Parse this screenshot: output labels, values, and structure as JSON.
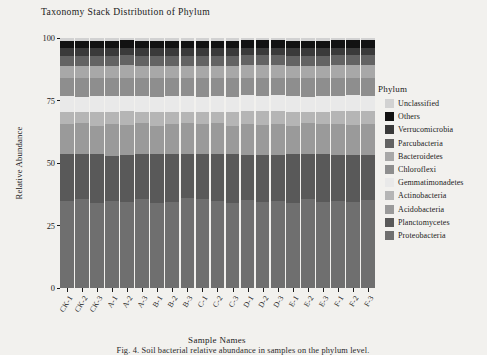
{
  "figure": {
    "title": "Taxonomy Stack Distribution of Phylum",
    "xlabel": "Sample Names",
    "ylabel": "Relative Abundance",
    "caption": "Fig. 4. Soil bacterial relative abundance in samples on the phylum level."
  },
  "legend": {
    "title": "Phylum"
  },
  "chart_data": {
    "type": "bar",
    "stacked": true,
    "title": "Taxonomy Stack Distribution of Phylum",
    "xlabel": "Sample Names",
    "ylabel": "Relative Abundance",
    "ylim": [
      0,
      100
    ],
    "yticks": [
      0,
      25,
      50,
      75,
      100
    ],
    "ytick_labels": [
      "0",
      "25",
      "50",
      "75",
      "100"
    ],
    "grid": false,
    "legend_position": "right",
    "legend_title": "Phylum",
    "categories": [
      "CK-1",
      "CK-2",
      "CK-3",
      "A-1",
      "A-2",
      "A-3",
      "B-1",
      "B-2",
      "B-3",
      "C-1",
      "C-2",
      "C-3",
      "D-1",
      "D-2",
      "D-3",
      "E-1",
      "E-2",
      "E-3",
      "F-1",
      "F-2",
      "F-3"
    ],
    "series": [
      {
        "name": "Proteobacteria",
        "color": "#6f6f6f",
        "values": [
          35.0,
          35.5,
          34.0,
          35.0,
          34.5,
          35.5,
          34.0,
          34.5,
          36.0,
          35.5,
          35.0,
          34.0,
          35.5,
          34.5,
          35.0,
          34.0,
          35.5,
          34.5,
          35.0,
          34.5,
          35.5
        ]
      },
      {
        "name": "Planctomycetes",
        "color": "#595959",
        "values": [
          18.5,
          18.0,
          19.5,
          18.0,
          19.0,
          18.0,
          19.5,
          19.0,
          17.5,
          18.0,
          18.5,
          19.5,
          18.0,
          19.0,
          18.5,
          19.5,
          18.0,
          19.0,
          18.5,
          19.0,
          18.0
        ]
      },
      {
        "name": "Acidobacteria",
        "color": "#9a9a9a",
        "values": [
          12.0,
          12.5,
          11.5,
          12.5,
          12.0,
          12.5,
          11.5,
          12.0,
          12.5,
          12.0,
          12.5,
          11.5,
          12.5,
          12.0,
          12.5,
          11.5,
          12.5,
          12.0,
          12.5,
          12.0,
          12.5
        ]
      },
      {
        "name": "Actinobacteria",
        "color": "#b5b5b5",
        "values": [
          5.0,
          4.5,
          5.5,
          5.0,
          5.5,
          4.5,
          5.5,
          5.0,
          4.5,
          5.0,
          4.5,
          5.5,
          5.0,
          5.5,
          5.0,
          5.5,
          4.5,
          5.0,
          5.0,
          5.5,
          5.0
        ]
      },
      {
        "name": "Gemmatimonadetes",
        "color": "#e9e9e9",
        "values": [
          6.5,
          6.0,
          6.5,
          6.5,
          6.0,
          6.5,
          6.0,
          6.5,
          6.5,
          6.0,
          6.5,
          6.0,
          6.5,
          6.0,
          6.5,
          6.5,
          6.0,
          6.5,
          6.0,
          6.5,
          6.0
        ]
      },
      {
        "name": "Chloroflexi",
        "color": "#8e8e8e",
        "values": [
          7.0,
          7.5,
          7.0,
          7.0,
          7.5,
          7.0,
          7.5,
          7.0,
          7.0,
          7.5,
          7.0,
          7.5,
          7.0,
          7.5,
          7.0,
          7.0,
          7.5,
          7.0,
          7.5,
          7.0,
          7.5
        ]
      },
      {
        "name": "Bacteroidetes",
        "color": "#a8a8a8",
        "values": [
          5.0,
          5.0,
          5.0,
          5.0,
          5.0,
          5.0,
          5.0,
          5.0,
          5.0,
          5.0,
          5.0,
          5.0,
          5.0,
          5.0,
          5.0,
          5.0,
          5.0,
          5.0,
          5.0,
          5.0,
          5.0
        ]
      },
      {
        "name": "Parcubacteria",
        "color": "#636363",
        "values": [
          4.0,
          4.0,
          4.0,
          4.0,
          4.0,
          4.0,
          4.0,
          4.0,
          4.0,
          4.0,
          4.0,
          4.0,
          4.0,
          4.0,
          4.0,
          4.0,
          4.0,
          4.0,
          4.0,
          4.0,
          4.0
        ]
      },
      {
        "name": "Verrucomicrobia",
        "color": "#3a3a3a",
        "values": [
          3.0,
          3.0,
          3.0,
          3.0,
          3.0,
          3.0,
          3.0,
          3.0,
          3.0,
          3.0,
          3.0,
          3.0,
          3.0,
          3.0,
          3.0,
          3.0,
          3.0,
          3.0,
          3.0,
          3.0,
          3.0
        ]
      },
      {
        "name": "Others",
        "color": "#121212",
        "values": [
          3.0,
          3.0,
          3.0,
          3.0,
          3.0,
          3.0,
          3.0,
          3.0,
          3.0,
          3.0,
          3.0,
          3.0,
          3.0,
          3.0,
          3.0,
          3.0,
          3.0,
          3.0,
          3.0,
          3.0,
          3.0
        ]
      },
      {
        "name": "Unclassified",
        "color": "#d2d2d2",
        "values": [
          1.0,
          1.0,
          1.0,
          1.0,
          1.0,
          1.0,
          1.0,
          1.0,
          1.0,
          1.0,
          1.0,
          1.0,
          1.0,
          1.0,
          1.0,
          1.0,
          1.0,
          1.0,
          1.0,
          1.0,
          1.0
        ]
      }
    ],
    "legend_order": [
      "Unclassified",
      "Others",
      "Verrucomicrobia",
      "Parcubacteria",
      "Bacteroidetes",
      "Chloroflexi",
      "Gemmatimonadetes",
      "Actinobacteria",
      "Acidobacteria",
      "Planctomycetes",
      "Proteobacteria"
    ]
  }
}
